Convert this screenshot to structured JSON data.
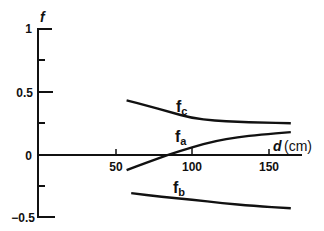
{
  "chart_data": {
    "type": "line",
    "title": "",
    "xlabel": "d (cm)",
    "ylabel": "f",
    "xlim": [
      0,
      172
    ],
    "ylim": [
      -0.5,
      1
    ],
    "x_ticks": [
      50,
      100,
      150
    ],
    "x_tick_labels": [
      "50",
      "100",
      "150"
    ],
    "y_ticks": [
      -0.5,
      -0.25,
      0,
      0.25,
      0.5,
      0.75,
      1
    ],
    "y_tick_labels": [
      "−0.5",
      "",
      "0",
      "",
      "0.5",
      "",
      "1"
    ],
    "grid": false,
    "legend": "inline labels",
    "series": [
      {
        "name": "f_c",
        "label_main": "f",
        "label_sub": "c",
        "x": [
          57,
          70,
          85,
          100,
          115,
          130,
          145,
          165
        ],
        "values": [
          0.43,
          0.39,
          0.34,
          0.29,
          0.27,
          0.26,
          0.255,
          0.25
        ]
      },
      {
        "name": "f_a",
        "label_main": "f",
        "label_sub": "a",
        "x": [
          57,
          70,
          84,
          100,
          115,
          130,
          145,
          165
        ],
        "values": [
          -0.12,
          -0.06,
          0.0,
          0.06,
          0.11,
          0.14,
          0.16,
          0.18
        ]
      },
      {
        "name": "f_b",
        "label_main": "f",
        "label_sub": "b",
        "x": [
          60,
          80,
          100,
          120,
          140,
          165
        ],
        "values": [
          -0.3,
          -0.33,
          -0.35,
          -0.38,
          -0.4,
          -0.42
        ]
      }
    ]
  },
  "labels": {
    "y_axis": "f",
    "x_axis_var": "d",
    "x_axis_unit": "(cm)",
    "tick_1": "1",
    "tick_05": "0.5",
    "tick_0": "0",
    "tick_m05": "−0.5",
    "tick_50": "50",
    "tick_100": "100",
    "tick_150": "150",
    "fc_main": "f",
    "fc_sub": "c",
    "fa_main": "f",
    "fa_sub": "a",
    "fb_main": "f",
    "fb_sub": "b"
  }
}
